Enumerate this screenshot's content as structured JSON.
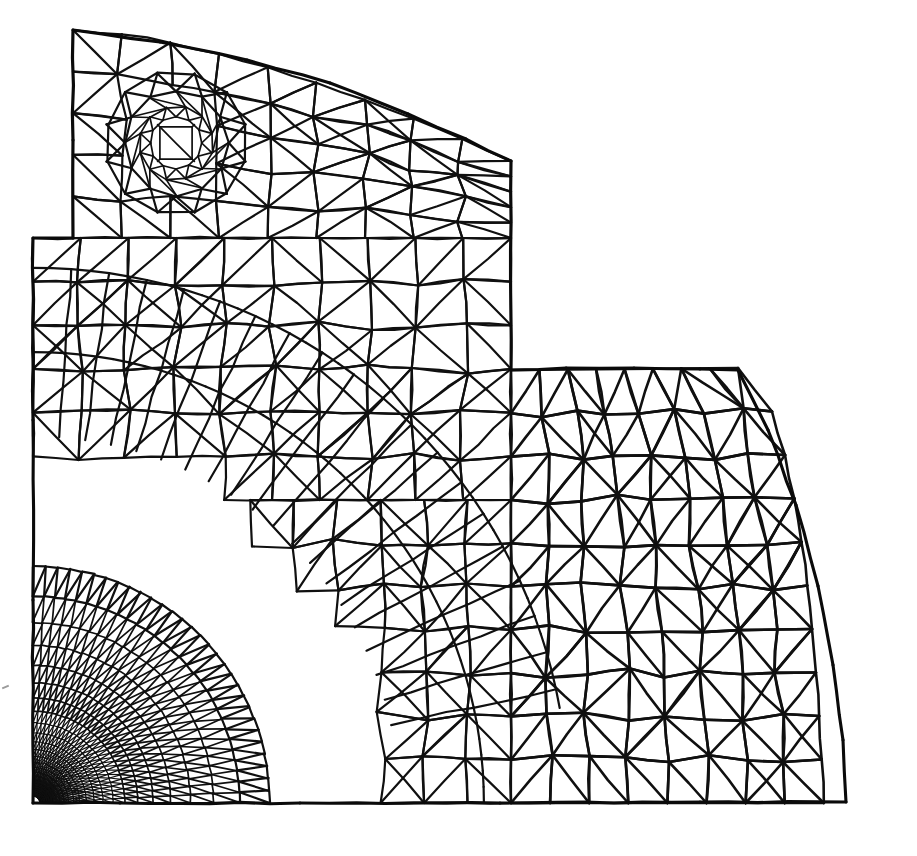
{
  "figure": {
    "kind": "finite-element-mesh",
    "width": 917,
    "height": 856,
    "background_color": "#ffffff",
    "line_color": "#101010",
    "element_type": "3-node linear triangle",
    "marks": {
      "corner_tick": {
        "name": "left-margin-tick",
        "x": 4,
        "y": 690
      }
    }
  },
  "chart_data": {
    "type": "diagram",
    "xlabel": "",
    "ylabel": "",
    "legend": [],
    "annotations": [],
    "mesh": {
      "stroke_width_coarse": 2.6,
      "stroke_width_medium": 2.2,
      "stroke_width_fine": 1.7,
      "stroke_width_ultrafine": 1.25,
      "jitter": 1.15,
      "outline": [
        [
          73,
          30
        ],
        [
          160,
          42
        ],
        [
          247,
          60
        ],
        [
          330,
          83
        ],
        [
          408,
          114
        ],
        [
          466,
          139
        ],
        [
          511,
          161
        ],
        [
          511,
          370
        ],
        [
          566,
          368
        ],
        [
          634,
          368
        ],
        [
          700,
          369
        ],
        [
          738,
          370
        ],
        [
          768,
          430
        ],
        [
          796,
          505
        ],
        [
          818,
          586
        ],
        [
          833,
          665
        ],
        [
          843,
          740
        ],
        [
          846,
          802
        ],
        [
          700,
          802
        ],
        [
          500,
          803
        ],
        [
          300,
          803
        ],
        [
          120,
          803
        ],
        [
          33,
          803
        ],
        [
          33,
          600
        ],
        [
          33,
          420
        ],
        [
          33,
          238
        ],
        [
          73,
          238
        ],
        [
          73,
          140
        ],
        [
          73,
          30
        ]
      ],
      "regions": [
        {
          "name": "upper-flange",
          "x0": 73,
          "y0": 30,
          "x1": 511,
          "y1": 238,
          "cols": 9,
          "rows": 5,
          "top_arc": true,
          "seed": 1171
        },
        {
          "name": "mid-web",
          "x0": 33,
          "y0": 238,
          "x1": 511,
          "y1": 500,
          "cols": 10,
          "rows": 6,
          "seed": 2293
        },
        {
          "name": "lower-web",
          "x0": 33,
          "y0": 500,
          "x1": 511,
          "y1": 803,
          "cols": 11,
          "rows": 7,
          "seed": 3319
        },
        {
          "name": "right-step",
          "x0": 511,
          "y0": 370,
          "x1": 846,
          "y1": 803,
          "cols": 8,
          "rows": 10,
          "right_arc": true,
          "seed": 4441
        }
      ],
      "hole": {
        "name": "circular-hole",
        "cx": 176,
        "cy": 143,
        "r_inner": 26,
        "r_rings": [
          26,
          37,
          52,
          72
        ],
        "sectors": 12,
        "seed": 5557
      },
      "corner_fan": {
        "name": "singular-corner-refinement",
        "cx": 33,
        "cy": 803,
        "r_min": 7,
        "r_max": 470,
        "rings": 26,
        "sectors": 30,
        "growth": 1.145,
        "angle_start": -90,
        "angle_end": 0,
        "seed": 6673
      }
    }
  }
}
